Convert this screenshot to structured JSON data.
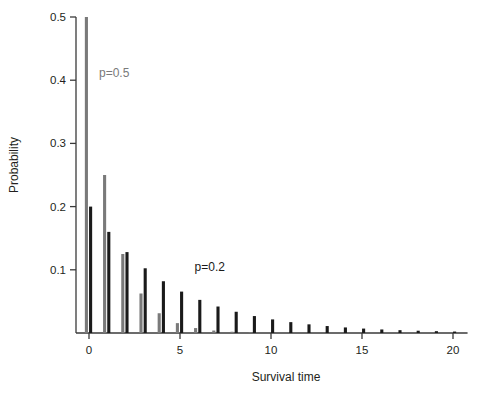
{
  "chart_data": {
    "type": "bar",
    "title": "",
    "subtitle": "",
    "xlabel": "Survival time",
    "ylabel": "Probability",
    "xlim": [
      -0.7,
      20.8
    ],
    "ylim": [
      0,
      0.5
    ],
    "grid": false,
    "legend_position": "inline-annotations",
    "x_ticks": [
      0,
      5,
      10,
      15,
      20
    ],
    "x_tick_labels": [
      "0",
      "5",
      "10",
      "15",
      "20"
    ],
    "y_ticks": [
      0.1,
      0.2,
      0.3,
      0.4,
      0.5
    ],
    "y_tick_labels": [
      "0.1",
      "0.2",
      "0.3",
      "0.4",
      "0.5"
    ],
    "x": [
      0,
      1,
      2,
      3,
      4,
      5,
      6,
      7,
      8,
      9,
      10,
      11,
      12,
      13,
      14,
      15,
      16,
      17,
      18,
      19,
      20
    ],
    "series": [
      {
        "name": "p=0.5",
        "color": "#7a7a7a",
        "annotation": "p=0.5",
        "values": [
          0.5,
          0.25,
          0.125,
          0.0625,
          0.03125,
          0.015625,
          0.0078,
          0.0039,
          0.002,
          0.001,
          0.0005,
          0.00024,
          0.00012,
          6e-05,
          3e-05,
          1.5e-05,
          8e-06,
          4e-06,
          2e-06,
          1e-06,
          5e-07
        ]
      },
      {
        "name": "p=0.2",
        "color": "#1a1a1a",
        "annotation": "p=0.2",
        "values": [
          0.2,
          0.16,
          0.128,
          0.1024,
          0.0819,
          0.0655,
          0.0524,
          0.0419,
          0.0336,
          0.0268,
          0.0215,
          0.0172,
          0.0137,
          0.011,
          0.0088,
          0.007,
          0.0056,
          0.0045,
          0.0036,
          0.0029,
          0.0023
        ]
      }
    ],
    "annotations": [
      {
        "text": "p=0.5",
        "x": 0.55,
        "y": 0.405,
        "color": "#7a7a7a"
      },
      {
        "text": "p=0.2",
        "x": 5.8,
        "y": 0.098,
        "color": "#1a1a1a"
      }
    ]
  },
  "axes": {
    "axis_color": "#3a3a3a",
    "text_color": "#231f20"
  }
}
